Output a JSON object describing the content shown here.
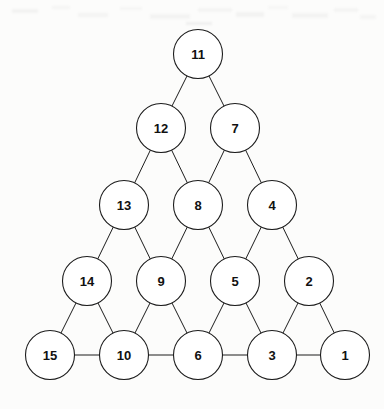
{
  "figure": {
    "kind": "triangular-number-graph",
    "background_color": "#fcfcfb",
    "node_fill": "#ffffff",
    "node_stroke": "#1d1d1d",
    "edge_stroke": "#1d1d1d",
    "label_color": "#111111",
    "node_radius": 24.5,
    "width": 384,
    "height": 409
  },
  "nodes": [
    {
      "id": "n11",
      "label": "11",
      "row": 1,
      "col": 1,
      "cx": 198,
      "cy": 54
    },
    {
      "id": "n12",
      "label": "12",
      "row": 2,
      "col": 1,
      "cx": 161,
      "cy": 128
    },
    {
      "id": "n7",
      "label": "7",
      "row": 2,
      "col": 2,
      "cx": 235,
      "cy": 128
    },
    {
      "id": "n13",
      "label": "13",
      "row": 3,
      "col": 1,
      "cx": 124,
      "cy": 205
    },
    {
      "id": "n8",
      "label": "8",
      "row": 3,
      "col": 2,
      "cx": 198,
      "cy": 205
    },
    {
      "id": "n4",
      "label": "4",
      "row": 3,
      "col": 3,
      "cx": 272,
      "cy": 205
    },
    {
      "id": "n14",
      "label": "14",
      "row": 4,
      "col": 1,
      "cx": 87,
      "cy": 281
    },
    {
      "id": "n9",
      "label": "9",
      "row": 4,
      "col": 2,
      "cx": 161,
      "cy": 281
    },
    {
      "id": "n5",
      "label": "5",
      "row": 4,
      "col": 3,
      "cx": 235,
      "cy": 281
    },
    {
      "id": "n2",
      "label": "2",
      "row": 4,
      "col": 4,
      "cx": 309,
      "cy": 281
    },
    {
      "id": "n15",
      "label": "15",
      "row": 5,
      "col": 1,
      "cx": 50,
      "cy": 355
    },
    {
      "id": "n10",
      "label": "10",
      "row": 5,
      "col": 2,
      "cx": 124,
      "cy": 355
    },
    {
      "id": "n6",
      "label": "6",
      "row": 5,
      "col": 3,
      "cx": 198,
      "cy": 355
    },
    {
      "id": "n3",
      "label": "3",
      "row": 5,
      "col": 4,
      "cx": 272,
      "cy": 355
    },
    {
      "id": "n1",
      "label": "1",
      "row": 5,
      "col": 5,
      "cx": 345,
      "cy": 355
    }
  ],
  "edges": [
    {
      "from": "n11",
      "to": "n12",
      "kind": "diagonal"
    },
    {
      "from": "n11",
      "to": "n7",
      "kind": "diagonal"
    },
    {
      "from": "n12",
      "to": "n13",
      "kind": "diagonal"
    },
    {
      "from": "n12",
      "to": "n8",
      "kind": "diagonal"
    },
    {
      "from": "n7",
      "to": "n8",
      "kind": "diagonal"
    },
    {
      "from": "n7",
      "to": "n4",
      "kind": "diagonal"
    },
    {
      "from": "n13",
      "to": "n14",
      "kind": "diagonal"
    },
    {
      "from": "n13",
      "to": "n9",
      "kind": "diagonal"
    },
    {
      "from": "n8",
      "to": "n9",
      "kind": "diagonal"
    },
    {
      "from": "n8",
      "to": "n5",
      "kind": "diagonal"
    },
    {
      "from": "n4",
      "to": "n5",
      "kind": "diagonal"
    },
    {
      "from": "n4",
      "to": "n2",
      "kind": "diagonal"
    },
    {
      "from": "n14",
      "to": "n15",
      "kind": "diagonal"
    },
    {
      "from": "n14",
      "to": "n10",
      "kind": "diagonal"
    },
    {
      "from": "n9",
      "to": "n10",
      "kind": "diagonal"
    },
    {
      "from": "n9",
      "to": "n6",
      "kind": "diagonal"
    },
    {
      "from": "n5",
      "to": "n6",
      "kind": "diagonal"
    },
    {
      "from": "n5",
      "to": "n3",
      "kind": "diagonal"
    },
    {
      "from": "n2",
      "to": "n3",
      "kind": "diagonal"
    },
    {
      "from": "n2",
      "to": "n1",
      "kind": "diagonal"
    },
    {
      "from": "n15",
      "to": "n10",
      "kind": "horizontal"
    },
    {
      "from": "n10",
      "to": "n6",
      "kind": "horizontal"
    },
    {
      "from": "n6",
      "to": "n3",
      "kind": "horizontal"
    },
    {
      "from": "n3",
      "to": "n1",
      "kind": "horizontal"
    }
  ],
  "artifacts": [
    {
      "x": 12,
      "y": 9,
      "w": 26,
      "h": 4,
      "o": 0.16
    },
    {
      "x": 52,
      "y": 6,
      "w": 18,
      "h": 3,
      "o": 0.12
    },
    {
      "x": 78,
      "y": 13,
      "w": 30,
      "h": 4,
      "o": 0.14
    },
    {
      "x": 120,
      "y": 7,
      "w": 22,
      "h": 3,
      "o": 0.11
    },
    {
      "x": 150,
      "y": 14,
      "w": 40,
      "h": 5,
      "o": 0.15
    },
    {
      "x": 198,
      "y": 8,
      "w": 34,
      "h": 4,
      "o": 0.13
    },
    {
      "x": 236,
      "y": 12,
      "w": 28,
      "h": 5,
      "o": 0.16
    },
    {
      "x": 268,
      "y": 6,
      "w": 20,
      "h": 3,
      "o": 0.1
    },
    {
      "x": 292,
      "y": 13,
      "w": 36,
      "h": 5,
      "o": 0.15
    },
    {
      "x": 334,
      "y": 8,
      "w": 24,
      "h": 4,
      "o": 0.13
    },
    {
      "x": 360,
      "y": 15,
      "w": 16,
      "h": 4,
      "o": 0.12
    },
    {
      "x": 186,
      "y": 22,
      "w": 26,
      "h": 3,
      "o": 0.22
    }
  ]
}
